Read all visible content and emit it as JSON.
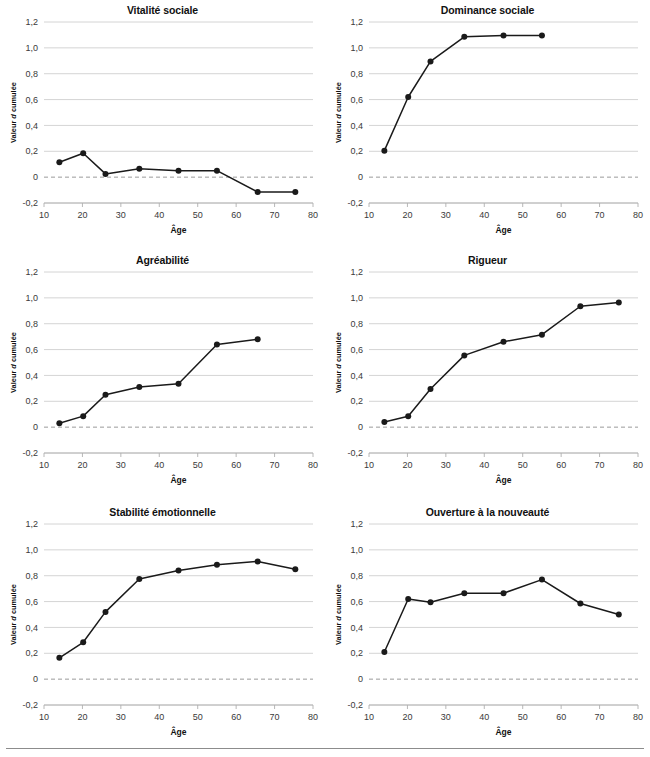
{
  "figure": {
    "width": 650,
    "height": 757,
    "background": "#ffffff",
    "rule_color": "#8c8c8c"
  },
  "common": {
    "xlabel": "Âge",
    "ylabel_plain": "Valeur d cumulée",
    "ylabel_parts": {
      "before": "Valeur ",
      "italic": "d",
      "after": " cumulée"
    },
    "x_ticks": [
      10,
      20,
      30,
      40,
      50,
      60,
      70,
      80
    ],
    "x_tick_labels": [
      "10",
      "20",
      "30",
      "40",
      "50",
      "60",
      "70",
      "80"
    ],
    "y_ticks": [
      -0.2,
      0,
      0.2,
      0.4,
      0.6,
      0.8,
      1.0,
      1.2
    ],
    "y_tick_labels": [
      "-0,2",
      "0",
      "0,2",
      "0,4",
      "0,6",
      "0,8",
      "1,0",
      "1,2"
    ],
    "xlim": [
      10,
      80
    ],
    "ylim": [
      -0.2,
      1.2
    ],
    "grid": true,
    "zero_reference": 0,
    "line_color": "#1a1a1a",
    "grid_color": "#c9c9c9",
    "zero_color": "#9a9a9a"
  },
  "chart_data": [
    {
      "type": "line",
      "title": "Vitalité sociale",
      "xlabel": "Âge",
      "ylabel": "Valeur d cumulée",
      "xlim": [
        10,
        80
      ],
      "ylim": [
        -0.2,
        1.2
      ],
      "x": [
        14,
        20.2,
        26,
        34.8,
        45,
        55,
        65.6,
        75.4
      ],
      "values": [
        0.115,
        0.185,
        0.025,
        0.065,
        0.05,
        0.05,
        -0.115,
        -0.115
      ]
    },
    {
      "type": "line",
      "title": "Dominance sociale",
      "xlabel": "Âge",
      "ylabel": "Valeur d cumulée",
      "xlim": [
        10,
        80
      ],
      "ylim": [
        -0.2,
        1.2
      ],
      "x": [
        14,
        20.2,
        26,
        34.8,
        45,
        55
      ],
      "values": [
        0.205,
        0.62,
        0.895,
        1.085,
        1.095,
        1.095
      ]
    },
    {
      "type": "line",
      "title": "Agréabilité",
      "xlabel": "Âge",
      "ylabel": "Valeur d cumulée",
      "xlim": [
        10,
        80
      ],
      "ylim": [
        -0.2,
        1.2
      ],
      "x": [
        14,
        20.2,
        26,
        34.8,
        45,
        55,
        65.6
      ],
      "values": [
        0.03,
        0.085,
        0.25,
        0.31,
        0.335,
        0.64,
        0.68
      ]
    },
    {
      "type": "line",
      "title": "Rigueur",
      "xlabel": "Âge",
      "ylabel": "Valeur d cumulée",
      "xlim": [
        10,
        80
      ],
      "ylim": [
        -0.2,
        1.2
      ],
      "x": [
        14,
        20.2,
        26,
        34.8,
        45,
        55,
        65,
        75
      ],
      "values": [
        0.04,
        0.085,
        0.295,
        0.555,
        0.66,
        0.715,
        0.935,
        0.965
      ]
    },
    {
      "type": "line",
      "title": "Stabilité émotionnelle",
      "xlabel": "Âge",
      "ylabel": "Valeur d cumulée",
      "xlim": [
        10,
        80
      ],
      "ylim": [
        -0.2,
        1.2
      ],
      "x": [
        14,
        20.2,
        26,
        34.8,
        45,
        55,
        65.6,
        75.4
      ],
      "values": [
        0.165,
        0.285,
        0.52,
        0.775,
        0.84,
        0.885,
        0.91,
        0.85
      ]
    },
    {
      "type": "line",
      "title": "Ouverture à la nouveauté",
      "xlabel": "Âge",
      "ylabel": "Valeur d cumulée",
      "xlim": [
        10,
        80
      ],
      "ylim": [
        -0.2,
        1.2
      ],
      "x": [
        14,
        20.2,
        26,
        34.8,
        45,
        55,
        65,
        75
      ],
      "values": [
        0.21,
        0.62,
        0.595,
        0.665,
        0.665,
        0.77,
        0.585,
        0.5
      ]
    }
  ]
}
